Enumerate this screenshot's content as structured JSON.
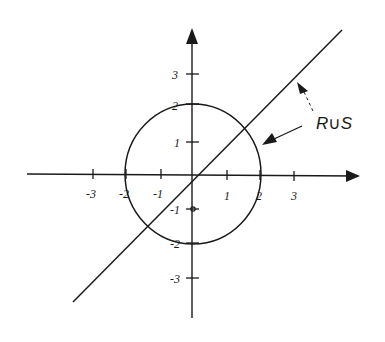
{
  "diagram": {
    "title": "",
    "x_axis": {
      "tick_labels": [
        "-3",
        "-2",
        "-1",
        "1",
        "2",
        "3"
      ]
    },
    "y_axis": {
      "tick_labels": [
        "3",
        "2",
        "1",
        "-1",
        "-2",
        "-3"
      ]
    },
    "shapes": {
      "circle": "x^2 + y^2 = 4 (radius 2, centered at origin)",
      "line": "y = x"
    },
    "annotation": {
      "label": "R∪S",
      "arrows": [
        "dashed arrow to line",
        "solid arrow to circle"
      ]
    },
    "colors": {
      "ink": "#1a1a1a",
      "background": "#ffffff"
    }
  }
}
